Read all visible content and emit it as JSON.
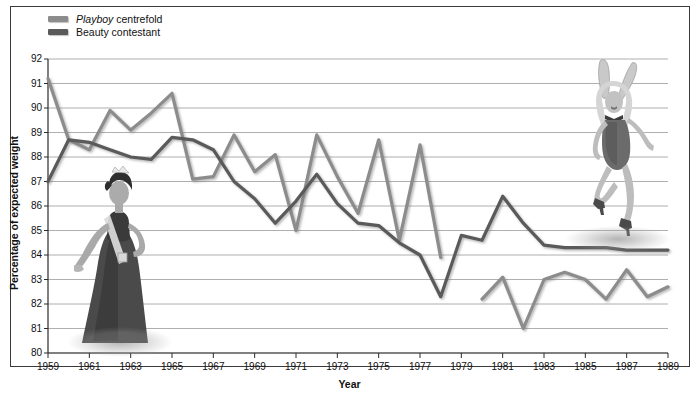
{
  "legend": {
    "items": [
      {
        "label_html": "<i>Playboy</i> centrefold",
        "name": "Playboy centrefold",
        "color": "#8c8c8c"
      },
      {
        "label_html": "Beauty contestant",
        "name": "Beauty contestant",
        "color": "#5a5a5a"
      }
    ]
  },
  "axes": {
    "ylabel": "Percentage of expected weight",
    "xlabel": "Year",
    "yticks": [
      80,
      81,
      82,
      83,
      84,
      85,
      86,
      87,
      88,
      89,
      90,
      91,
      92
    ],
    "xticks": [
      1959,
      1961,
      1963,
      1965,
      1967,
      1969,
      1971,
      1973,
      1975,
      1977,
      1979,
      1981,
      1983,
      1985,
      1987,
      1989
    ]
  },
  "figures": {
    "beauty_contestant": {
      "name": "beauty-contestant-illustration",
      "alt": "Beauty contestant in gown with sash and tiara"
    },
    "playboy_centrefold": {
      "name": "playboy-bunny-illustration",
      "alt": "Playboy bunny centrefold in corset with ears"
    }
  },
  "chart_data": {
    "type": "line",
    "title": "",
    "xlabel": "Year",
    "ylabel": "Percentage of expected weight",
    "xlim": [
      1959,
      1989
    ],
    "ylim": [
      80,
      92
    ],
    "grid": true,
    "legend_position": "top-left",
    "x": [
      1959,
      1960,
      1961,
      1962,
      1963,
      1964,
      1965,
      1966,
      1967,
      1968,
      1969,
      1970,
      1971,
      1972,
      1973,
      1974,
      1975,
      1976,
      1977,
      1978,
      1979,
      1980,
      1981,
      1982,
      1983,
      1984,
      1985,
      1986,
      1987,
      1988,
      1989
    ],
    "series": [
      {
        "name": "Playboy centrefold",
        "color": "#8c8c8c",
        "values": [
          91.2,
          88.7,
          88.3,
          89.9,
          89.1,
          89.8,
          90.6,
          87.1,
          87.2,
          88.9,
          87.4,
          88.1,
          85.0,
          88.9,
          87.2,
          85.7,
          88.7,
          84.6,
          88.5,
          83.9,
          null,
          82.2,
          83.1,
          81.0,
          83.0,
          83.3,
          83.0,
          82.2,
          83.4,
          82.3,
          82.7
        ]
      },
      {
        "name": "Beauty contestant",
        "color": "#5a5a5a",
        "values": [
          87.0,
          88.7,
          88.6,
          88.3,
          88.0,
          87.9,
          88.8,
          88.7,
          88.3,
          87.0,
          86.3,
          85.3,
          86.2,
          87.3,
          86.1,
          85.3,
          85.2,
          84.5,
          84.0,
          82.3,
          84.8,
          84.6,
          86.4,
          85.3,
          84.4,
          84.3,
          84.3,
          84.3,
          84.2,
          84.2,
          84.2
        ]
      }
    ]
  }
}
